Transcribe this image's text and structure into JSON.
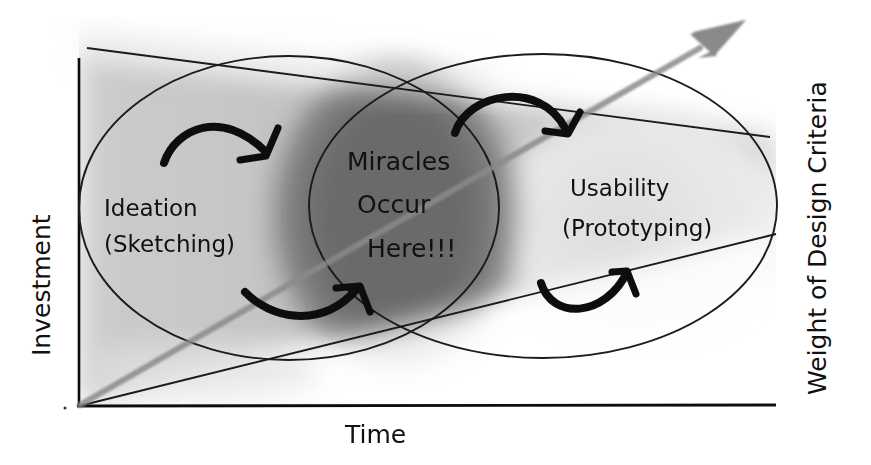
{
  "diagram": {
    "type": "hand-drawn concept diagram",
    "axes": {
      "x_label": "Time",
      "y_label": "Investment",
      "right_label": "Weight of Design Criteria"
    },
    "regions": {
      "left": {
        "title": "Ideation",
        "subtitle": "(Sketching)"
      },
      "center": {
        "line1": "Miracles",
        "line2": "Occur",
        "line3": "Here!!!"
      },
      "right": {
        "title": "Usability",
        "subtitle": "(Prototyping)"
      }
    },
    "elements": {
      "trend_arrow": "gray diagonal arrow rising from origin to top-right",
      "upper_line": "line descending from top-left to right boundary",
      "lower_line": "line rising from origin to right boundary",
      "cycle_arrows_count": 4,
      "boundary": "dashed vertical line at right edge"
    },
    "colors": {
      "ink": "#111111",
      "shade_dark": "#6e6e6e",
      "shade_light": "#d8d8d8",
      "arrow_gray": "#8a8a8a",
      "background": "#ffffff"
    }
  }
}
